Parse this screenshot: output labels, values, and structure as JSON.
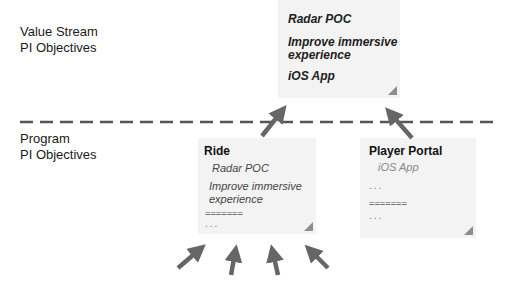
{
  "levels": {
    "value_stream": [
      "Value Stream",
      "PI Objectives"
    ],
    "program": [
      "Program",
      "PI Objectives"
    ]
  },
  "value_stream_card": {
    "items": [
      "Radar POC",
      "Improve immersive",
      "experience",
      "iOS App"
    ]
  },
  "program_cards": [
    {
      "title": "Ride",
      "items": [
        "Radar POC",
        "Improve immersive",
        "experience"
      ],
      "separator": "=======",
      "ellipsis": "..."
    },
    {
      "title": "Player Portal",
      "items": [
        "iOS App"
      ],
      "ellipsis_top": "...",
      "separator": "=======",
      "ellipsis": "..."
    }
  ],
  "colors": {
    "card_bg": "#f3f3f3",
    "arrow": "#666666",
    "divider": "#555555",
    "fold": "#8c8c8c"
  }
}
